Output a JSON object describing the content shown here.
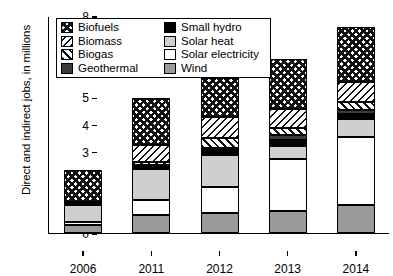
{
  "chart_data": {
    "type": "bar",
    "stacked": true,
    "title": "",
    "xlabel": "",
    "ylabel": "Direct and indirect jobs, in millions",
    "categories": [
      "2006",
      "2011",
      "2012",
      "2013",
      "2014"
    ],
    "ylim": [
      0,
      8
    ],
    "y_ticks": [
      0,
      1,
      2,
      3,
      4,
      5,
      6,
      7,
      8
    ],
    "grid": false,
    "legend_position": "top-left inside plot",
    "series": [
      {
        "name": "Wind",
        "pattern": "solid-medium-gray",
        "color": "#9a9a9a",
        "values": [
          0.3,
          0.67,
          0.75,
          0.83,
          1.03
        ]
      },
      {
        "name": "Solar electricity",
        "pattern": "solid-white",
        "color": "#ffffff",
        "values": [
          0.12,
          0.55,
          0.93,
          1.89,
          2.5
        ]
      },
      {
        "name": "Solar heat",
        "pattern": "solid-light-gray",
        "color": "#cfcfcf",
        "values": [
          0.63,
          1.15,
          1.2,
          0.49,
          0.66
        ]
      },
      {
        "name": "Small hydro",
        "pattern": "solid-black",
        "color": "#000000",
        "values": [
          0.06,
          0.08,
          0.2,
          0.22,
          0.2
        ]
      },
      {
        "name": "Geothermal",
        "pattern": "solid-dark-gray",
        "color": "#3b3b3b",
        "values": [
          0.03,
          0.05,
          0.07,
          0.18,
          0.15
        ]
      },
      {
        "name": "Biogas",
        "pattern": "diagonal-hatch",
        "color": "#ffffff",
        "values": [
          0.0,
          0.1,
          0.35,
          0.26,
          0.3
        ]
      },
      {
        "name": "Biomass",
        "pattern": "diagonal-lines",
        "color": "#ffffff",
        "values": [
          0.0,
          0.65,
          0.78,
          0.71,
          0.74
        ]
      },
      {
        "name": "Biofuels",
        "pattern": "checkerboard",
        "color": "#ffffff",
        "values": [
          1.18,
          1.73,
          1.42,
          1.82,
          2.0
        ]
      }
    ],
    "totals": [
      2.32,
      4.98,
      5.7,
      6.4,
      7.58
    ]
  },
  "legend": {
    "items": [
      {
        "label": "Biofuels",
        "swatch": "checkerboard-swatch"
      },
      {
        "label": "Biomass",
        "swatch": "diagonal-lines-swatch"
      },
      {
        "label": "Biogas",
        "swatch": "diagonal-hatch-swatch"
      },
      {
        "label": "Geothermal",
        "swatch": "dark-gray-swatch"
      },
      {
        "label": "Small hydro",
        "swatch": "black-swatch"
      },
      {
        "label": "Solar heat",
        "swatch": "light-gray-swatch"
      },
      {
        "label": "Solar electricity",
        "swatch": "white-swatch"
      },
      {
        "label": "Wind",
        "swatch": "medium-gray-swatch"
      }
    ]
  },
  "axes": {
    "y_labels": [
      "8",
      "7",
      "6",
      "5",
      "4",
      "3",
      "2",
      "1",
      "0"
    ],
    "x_labels": [
      "2006",
      "2011",
      "2012",
      "2013",
      "2014"
    ]
  }
}
